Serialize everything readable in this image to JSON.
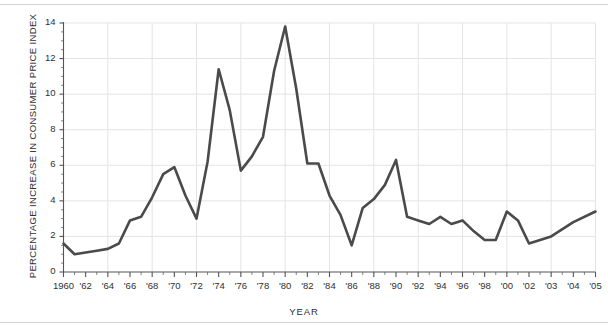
{
  "chart_data": {
    "type": "line",
    "title": "",
    "xlabel": "YEAR",
    "ylabel": "PERCENTAGE INCREASE IN CONSUMER PRICE INDEX",
    "xlim": [
      1960,
      2005
    ],
    "ylim": [
      0,
      14
    ],
    "yticks": [
      0,
      2,
      4,
      6,
      8,
      10,
      12,
      14
    ],
    "ytick_labels": [
      "0",
      "2",
      "4",
      "6",
      "8",
      "10",
      "12",
      "14"
    ],
    "xticks": [
      1960,
      1962,
      1964,
      1966,
      1968,
      1970,
      1972,
      1974,
      1976,
      1978,
      1980,
      1982,
      1984,
      1986,
      1988,
      1990,
      1992,
      1994,
      1996,
      1998,
      2000,
      2002,
      2003,
      2004,
      2005
    ],
    "xtick_labels": [
      "1960",
      "'62",
      "'64",
      "'66",
      "'68",
      "'70",
      "'72",
      "'74",
      "'76",
      "'78",
      "'80",
      "'82",
      "'84",
      "'86",
      "'88",
      "'90",
      "'92",
      "'94",
      "'96",
      "'98",
      "'00",
      "'02",
      "'03",
      "'04",
      "'05"
    ],
    "grid": true,
    "grid_color": "#e4e4e4",
    "legend": "none",
    "line_color": "#4a4a4a",
    "line_width": 2.6,
    "x": [
      1960,
      1961,
      1962,
      1963,
      1964,
      1965,
      1966,
      1967,
      1968,
      1969,
      1970,
      1971,
      1972,
      1973,
      1974,
      1975,
      1976,
      1977,
      1978,
      1979,
      1980,
      1981,
      1982,
      1983,
      1984,
      1985,
      1986,
      1987,
      1988,
      1989,
      1990,
      1991,
      1992,
      1993,
      1994,
      1995,
      1996,
      1997,
      1998,
      1999,
      2000,
      2001,
      2002,
      2003,
      2004,
      2005
    ],
    "values": [
      1.6,
      1.0,
      1.1,
      1.2,
      1.3,
      1.6,
      2.9,
      3.1,
      4.2,
      5.5,
      5.9,
      4.3,
      3.0,
      6.2,
      11.4,
      9.1,
      5.7,
      6.5,
      7.6,
      11.3,
      13.8,
      10.3,
      6.1,
      6.1,
      4.3,
      3.2,
      1.5,
      3.6,
      4.1,
      4.9,
      6.3,
      3.1,
      2.9,
      2.7,
      3.1,
      2.7,
      2.9,
      2.3,
      1.8,
      1.8,
      3.4,
      2.9,
      1.6,
      2.0,
      2.8,
      3.4
    ]
  }
}
